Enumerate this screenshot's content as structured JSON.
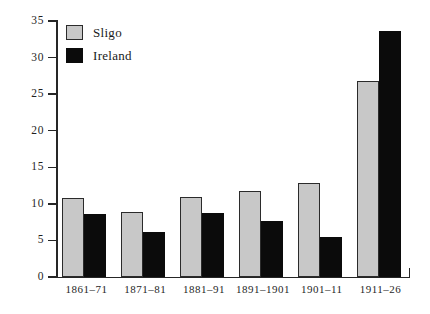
{
  "chart_data": {
    "type": "bar",
    "title": "",
    "subtitle": "",
    "xlabel": "",
    "ylabel": "",
    "ylim": [
      0,
      35
    ],
    "yticks": [
      0,
      5,
      10,
      15,
      20,
      25,
      30,
      35
    ],
    "ytick_labels": [
      "0",
      "5",
      "10",
      "15",
      "20",
      "25",
      "30",
      "35"
    ],
    "grid": false,
    "legend_position": "top-left",
    "categories": [
      "1861–71",
      "1871–81",
      "1881–91",
      "1891–1901",
      "1901–11",
      "1911–26"
    ],
    "series": [
      {
        "name": "Sligo",
        "color": "#c8c8c8",
        "values": [
          10.8,
          8.9,
          11.0,
          11.8,
          12.8,
          26.8
        ]
      },
      {
        "name": "Ireland",
        "color": "#0b0b0b",
        "values": [
          8.6,
          6.2,
          8.8,
          7.7,
          5.5,
          33.7
        ]
      }
    ]
  },
  "legend": {
    "entries": [
      {
        "label": "Sligo",
        "swatch": "legend-swatch-sligo"
      },
      {
        "label": "Ireland",
        "swatch": "legend-swatch-ireland"
      }
    ]
  }
}
